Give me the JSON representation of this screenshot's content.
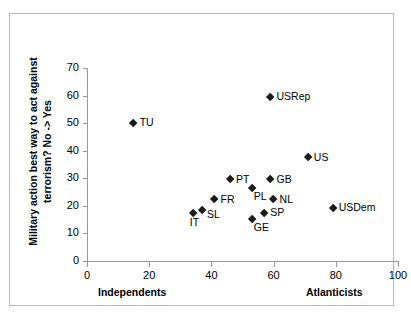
{
  "chart_data": {
    "type": "scatter",
    "title": "",
    "xlabel": "",
    "ylabel": "Military action best way to act against terrorism? No -> Yes",
    "xlim": [
      0,
      100
    ],
    "ylim": [
      0,
      70
    ],
    "xticks": [
      0,
      20,
      40,
      60,
      80,
      100
    ],
    "yticks": [
      0,
      10,
      20,
      30,
      40,
      50,
      60,
      70
    ],
    "grid": false,
    "legend": "none",
    "x_axis_left_caption": "Independents",
    "x_axis_right_caption": "Atlanticists",
    "marker": "diamond",
    "marker_color": "#1a1a1a",
    "points": [
      {
        "label": "TU",
        "x": 15,
        "y": 50.0,
        "label_pos": "right"
      },
      {
        "label": "USRep",
        "x": 59,
        "y": 59.5,
        "label_pos": "right"
      },
      {
        "label": "US",
        "x": 71,
        "y": 37.5,
        "label_pos": "right"
      },
      {
        "label": "USDem",
        "x": 79,
        "y": 19.3,
        "label_pos": "right"
      },
      {
        "label": "PT",
        "x": 46,
        "y": 29.5,
        "label_pos": "right"
      },
      {
        "label": "GB",
        "x": 59,
        "y": 29.5,
        "label_pos": "right"
      },
      {
        "label": "PL",
        "x": 53,
        "y": 26.5,
        "label_pos": "below-right"
      },
      {
        "label": "NL",
        "x": 60,
        "y": 22.3,
        "label_pos": "right"
      },
      {
        "label": "FR",
        "x": 41,
        "y": 22.3,
        "label_pos": "right"
      },
      {
        "label": "SL",
        "x": 37,
        "y": 18.5,
        "label_pos": "right-down"
      },
      {
        "label": "IT",
        "x": 34,
        "y": 17.2,
        "label_pos": "below"
      },
      {
        "label": "SP",
        "x": 57,
        "y": 17.3,
        "label_pos": "right"
      },
      {
        "label": "GE",
        "x": 53,
        "y": 15.3,
        "label_pos": "below-right"
      }
    ]
  },
  "axis": {
    "y_title": "Military action best way to act against terrorism? No -> Yes",
    "x_left_caption": "Independents",
    "x_right_caption": "Atlanticists",
    "y_ticks": [
      "70",
      "60",
      "50",
      "40",
      "30",
      "20",
      "10",
      "0"
    ],
    "x_ticks": [
      "0",
      "20",
      "40",
      "60",
      "80",
      "100"
    ]
  }
}
